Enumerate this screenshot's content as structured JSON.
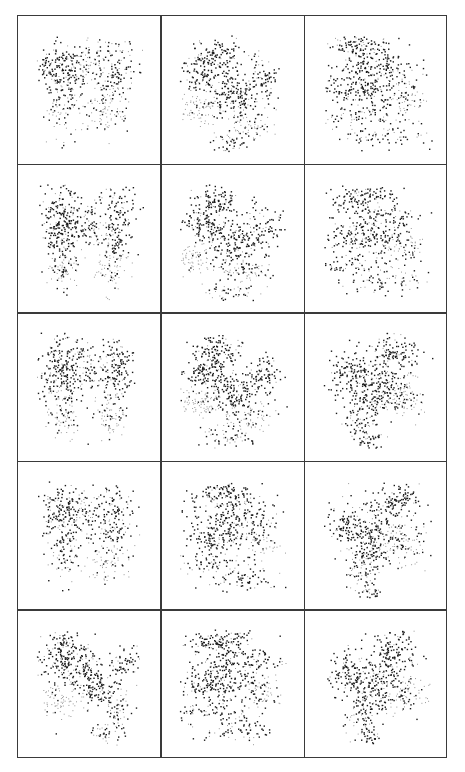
{
  "figure": {
    "rows": 5,
    "cols": 3,
    "ink_color": "#1a1a1a",
    "light_color": "#9a9a9a",
    "border_color": "#3a3a3a",
    "background": "#ffffff"
  },
  "panels": [
    {
      "row": 0,
      "col": 0,
      "shape": "butterfly",
      "seed": 11,
      "density": 0.9
    },
    {
      "row": 0,
      "col": 1,
      "shape": "scatter-tilted",
      "seed": 12,
      "density": 0.85
    },
    {
      "row": 0,
      "col": 2,
      "shape": "block-streaks",
      "seed": 13,
      "density": 0.95
    },
    {
      "row": 1,
      "col": 0,
      "shape": "butterfly-vertical",
      "seed": 21,
      "density": 1.0
    },
    {
      "row": 1,
      "col": 1,
      "shape": "scatter-tilted",
      "seed": 22,
      "density": 0.85
    },
    {
      "row": 1,
      "col": 2,
      "shape": "block-streaks",
      "seed": 23,
      "density": 0.85
    },
    {
      "row": 2,
      "col": 0,
      "shape": "butterfly-vertical",
      "seed": 31,
      "density": 0.95
    },
    {
      "row": 2,
      "col": 1,
      "shape": "scatter-tilted",
      "seed": 32,
      "density": 0.9
    },
    {
      "row": 2,
      "col": 2,
      "shape": "diamond",
      "seed": 33,
      "density": 0.9
    },
    {
      "row": 3,
      "col": 0,
      "shape": "butterfly",
      "seed": 41,
      "density": 0.85
    },
    {
      "row": 3,
      "col": 1,
      "shape": "block-streaks",
      "seed": 42,
      "density": 0.9
    },
    {
      "row": 3,
      "col": 2,
      "shape": "diamond",
      "seed": 43,
      "density": 0.85
    },
    {
      "row": 4,
      "col": 0,
      "shape": "blob-left",
      "seed": 51,
      "density": 0.9
    },
    {
      "row": 4,
      "col": 1,
      "shape": "block-streaks",
      "seed": 52,
      "density": 1.0
    },
    {
      "row": 4,
      "col": 2,
      "shape": "diamond",
      "seed": 53,
      "density": 0.85
    }
  ],
  "shapes": {
    "butterfly": [
      {
        "cx": 0.32,
        "cy": 0.35,
        "sx": 0.12,
        "sy": 0.12,
        "n": 420,
        "dark": 0.8
      },
      {
        "cx": 0.68,
        "cy": 0.38,
        "sx": 0.08,
        "sy": 0.14,
        "n": 260,
        "dark": 0.7
      },
      {
        "cx": 0.3,
        "cy": 0.62,
        "sx": 0.07,
        "sy": 0.12,
        "n": 140,
        "dark": 0.5
      },
      {
        "cx": 0.62,
        "cy": 0.66,
        "sx": 0.08,
        "sy": 0.08,
        "n": 140,
        "dark": 0.2
      },
      {
        "cx": 0.5,
        "cy": 0.3,
        "sx": 0.06,
        "sy": 0.08,
        "n": 80,
        "dark": 0.3
      }
    ],
    "butterfly-vertical": [
      {
        "cx": 0.3,
        "cy": 0.38,
        "sx": 0.08,
        "sy": 0.16,
        "n": 420,
        "dark": 0.85
      },
      {
        "cx": 0.7,
        "cy": 0.38,
        "sx": 0.06,
        "sy": 0.16,
        "n": 260,
        "dark": 0.75
      },
      {
        "cx": 0.5,
        "cy": 0.4,
        "sx": 0.08,
        "sy": 0.1,
        "n": 160,
        "dark": 0.6
      },
      {
        "cx": 0.3,
        "cy": 0.7,
        "sx": 0.06,
        "sy": 0.1,
        "n": 120,
        "dark": 0.3
      },
      {
        "cx": 0.65,
        "cy": 0.7,
        "sx": 0.07,
        "sy": 0.1,
        "n": 120,
        "dark": 0.2
      }
    ],
    "scatter-tilted": [
      {
        "cx": 0.38,
        "cy": 0.25,
        "sx": 0.1,
        "sy": 0.07,
        "n": 240,
        "dark": 0.8
      },
      {
        "cx": 0.3,
        "cy": 0.4,
        "sx": 0.1,
        "sy": 0.06,
        "n": 200,
        "dark": 0.8
      },
      {
        "cx": 0.5,
        "cy": 0.53,
        "sx": 0.1,
        "sy": 0.08,
        "n": 260,
        "dark": 0.85
      },
      {
        "cx": 0.72,
        "cy": 0.42,
        "sx": 0.07,
        "sy": 0.08,
        "n": 160,
        "dark": 0.8
      },
      {
        "cx": 0.25,
        "cy": 0.62,
        "sx": 0.1,
        "sy": 0.06,
        "n": 160,
        "dark": 0.1
      },
      {
        "cx": 0.6,
        "cy": 0.72,
        "sx": 0.1,
        "sy": 0.07,
        "n": 150,
        "dark": 0.4
      },
      {
        "cx": 0.45,
        "cy": 0.85,
        "sx": 0.1,
        "sy": 0.05,
        "n": 90,
        "dark": 0.6
      }
    ],
    "block-streaks": [
      {
        "cx": 0.4,
        "cy": 0.2,
        "sx": 0.14,
        "sy": 0.05,
        "n": 220,
        "dark": 0.8
      },
      {
        "cx": 0.5,
        "cy": 0.35,
        "sx": 0.18,
        "sy": 0.06,
        "n": 240,
        "dark": 0.8
      },
      {
        "cx": 0.4,
        "cy": 0.5,
        "sx": 0.16,
        "sy": 0.07,
        "n": 300,
        "dark": 0.85
      },
      {
        "cx": 0.35,
        "cy": 0.68,
        "sx": 0.15,
        "sy": 0.04,
        "n": 110,
        "dark": 0.6
      },
      {
        "cx": 0.55,
        "cy": 0.8,
        "sx": 0.18,
        "sy": 0.05,
        "n": 130,
        "dark": 0.7
      },
      {
        "cx": 0.7,
        "cy": 0.55,
        "sx": 0.08,
        "sy": 0.06,
        "n": 100,
        "dark": 0.4
      }
    ],
    "diamond": [
      {
        "cx": 0.62,
        "cy": 0.25,
        "sx": 0.1,
        "sy": 0.07,
        "n": 220,
        "dark": 0.85
      },
      {
        "cx": 0.3,
        "cy": 0.42,
        "sx": 0.09,
        "sy": 0.09,
        "n": 240,
        "dark": 0.85
      },
      {
        "cx": 0.52,
        "cy": 0.45,
        "sx": 0.1,
        "sy": 0.08,
        "n": 220,
        "dark": 0.75
      },
      {
        "cx": 0.45,
        "cy": 0.6,
        "sx": 0.08,
        "sy": 0.06,
        "n": 160,
        "dark": 0.8
      },
      {
        "cx": 0.7,
        "cy": 0.55,
        "sx": 0.09,
        "sy": 0.08,
        "n": 180,
        "dark": 0.35
      },
      {
        "cx": 0.38,
        "cy": 0.75,
        "sx": 0.07,
        "sy": 0.07,
        "n": 110,
        "dark": 0.6
      },
      {
        "cx": 0.45,
        "cy": 0.88,
        "sx": 0.05,
        "sy": 0.05,
        "n": 70,
        "dark": 0.7
      }
    ],
    "blob-left": [
      {
        "cx": 0.3,
        "cy": 0.3,
        "sx": 0.09,
        "sy": 0.12,
        "n": 380,
        "dark": 0.85
      },
      {
        "cx": 0.55,
        "cy": 0.52,
        "sx": 0.09,
        "sy": 0.07,
        "n": 220,
        "dark": 0.85
      },
      {
        "cx": 0.5,
        "cy": 0.35,
        "sx": 0.06,
        "sy": 0.07,
        "n": 110,
        "dark": 0.7
      },
      {
        "cx": 0.76,
        "cy": 0.35,
        "sx": 0.06,
        "sy": 0.06,
        "n": 110,
        "dark": 0.75
      },
      {
        "cx": 0.28,
        "cy": 0.62,
        "sx": 0.1,
        "sy": 0.08,
        "n": 150,
        "dark": 0.1
      },
      {
        "cx": 0.7,
        "cy": 0.68,
        "sx": 0.05,
        "sy": 0.1,
        "n": 110,
        "dark": 0.55
      },
      {
        "cx": 0.62,
        "cy": 0.84,
        "sx": 0.06,
        "sy": 0.05,
        "n": 70,
        "dark": 0.5
      }
    ]
  }
}
